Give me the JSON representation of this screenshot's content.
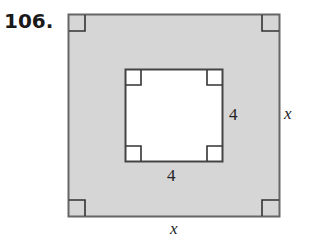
{
  "problem": {
    "number": "106."
  },
  "figure": {
    "outer_square": {
      "side_label": "x",
      "fill": "#d4d4d4",
      "stroke": "#555555"
    },
    "inner_square": {
      "side_label": "4",
      "fill": "#ffffff",
      "stroke": "#444444"
    },
    "labels": {
      "inner_right": "4",
      "inner_bottom": "4",
      "outer_right": "x",
      "outer_bottom": "x"
    }
  }
}
